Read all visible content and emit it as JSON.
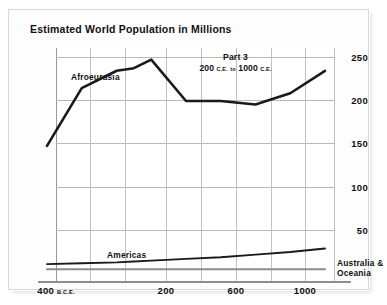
{
  "chart_title": "Estimated World Population in Millions",
  "annotation": {
    "part_title": "Part 3",
    "range_start": "200",
    "range_start_era": "C.E.",
    "range_join": "to",
    "range_end": "1000",
    "range_end_era": "C.E."
  },
  "axis": {
    "y_ticks": [
      "50",
      "100",
      "150",
      "200",
      "250"
    ],
    "x_ticks": [
      {
        "label": "400",
        "era": "B.C.E."
      },
      {
        "label": "200",
        "era": ""
      },
      {
        "label": "600",
        "era": ""
      },
      {
        "label": "1000",
        "era": ""
      }
    ]
  },
  "series_labels": {
    "afroeurasia": "Afroeurasia",
    "americas": "Americas",
    "australia_line1": "Australia &",
    "australia_line2": "Oceania"
  },
  "colors": {
    "line": "#1a1a1a",
    "australia_line": "#8c8c8c",
    "shade_band": "#dedede",
    "gridline": "#b9b9b9",
    "axis": "#8e8e8e",
    "background": "#ffffff"
  },
  "chart_data": {
    "type": "line",
    "title": "Estimated World Population in Millions",
    "xlabel": "",
    "ylabel": "",
    "xlim": [
      -400,
      1200
    ],
    "ylim": [
      0,
      270
    ],
    "grid": true,
    "legend": "inline-labels",
    "shaded_region": {
      "from": 200,
      "to": 1000,
      "label": "Part 3: 200 C.E. to 1000 C.E."
    },
    "x": [
      -400,
      -200,
      1,
      100,
      200,
      400,
      600,
      800,
      1000,
      1200
    ],
    "series": [
      {
        "name": "Afroeurasia",
        "values": [
          145,
          212,
          232,
          235,
          245,
          197,
          197,
          193,
          206,
          232
        ]
      },
      {
        "name": "Americas",
        "values": [
          8,
          9,
          10,
          11,
          12,
          14,
          16,
          19,
          22,
          26
        ]
      },
      {
        "name": "Australia & Oceania",
        "values": [
          2,
          2,
          2,
          2,
          2,
          2,
          2,
          2,
          2,
          2
        ]
      }
    ]
  }
}
